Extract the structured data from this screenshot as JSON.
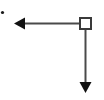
{
  "figure": {
    "title": "",
    "width": 104,
    "height": 100,
    "background_color": "#ffffff"
  },
  "chart_data": {
    "type": "diagram",
    "title": "",
    "xlabel": "",
    "ylabel": "",
    "xlim": [
      0,
      104
    ],
    "ylim": [
      0,
      100
    ],
    "grid": false,
    "legend": null,
    "annotations": [],
    "elements": [
      {
        "name": "origin-dot",
        "shape": "dot",
        "x": 2.5,
        "y": 12.5,
        "radius": 1.6,
        "color": "#1a1a1a",
        "label": ""
      },
      {
        "name": "node-square",
        "shape": "square",
        "x": 79,
        "y": 17,
        "width": 13,
        "height": 13,
        "stroke_color": "#3a3a3a",
        "fill_color": "#ffffff",
        "stroke_width": 2,
        "label": ""
      },
      {
        "name": "horizontal-arrow",
        "shape": "arrow",
        "from": [
          79,
          23.5
        ],
        "to": [
          14,
          23.5
        ],
        "direction": "left",
        "color": "#4a4a4a",
        "line_width": 2,
        "arrowhead": {
          "at": "to",
          "length": 11,
          "half_width": 6,
          "color": "#111111"
        },
        "label": ""
      },
      {
        "name": "vertical-arrow",
        "shape": "arrow",
        "from": [
          85.5,
          30
        ],
        "to": [
          85.5,
          93
        ],
        "direction": "down",
        "color": "#4a4a4a",
        "line_width": 2,
        "arrowhead": {
          "at": "to",
          "length": 11,
          "half_width": 6,
          "color": "#111111"
        },
        "label": ""
      }
    ],
    "colors": {
      "line": "#4a4a4a",
      "arrowhead": "#111111",
      "node_stroke": "#3a3a3a",
      "node_fill": "#ffffff",
      "dot": "#1a1a1a",
      "background": "#ffffff"
    }
  }
}
